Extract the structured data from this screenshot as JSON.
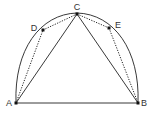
{
  "diagram": {
    "type": "geometry",
    "colors": {
      "stroke": "#222222",
      "point": "#111111",
      "label": "#333333",
      "background": "#ffffff"
    },
    "points": [
      {
        "id": "A",
        "label": "A",
        "x": 16,
        "y": 103,
        "lx": 9,
        "ly": 106
      },
      {
        "id": "B",
        "label": "B",
        "x": 138,
        "y": 103,
        "lx": 144,
        "ly": 106
      },
      {
        "id": "C",
        "label": "C",
        "x": 77,
        "y": 14,
        "lx": 77,
        "ly": 10
      },
      {
        "id": "D",
        "label": "D",
        "x": 43,
        "y": 30,
        "lx": 34,
        "ly": 31
      },
      {
        "id": "E",
        "label": "E",
        "x": 109,
        "y": 28,
        "lx": 118,
        "ly": 28
      }
    ],
    "solid_segments": [
      [
        "A",
        "B"
      ],
      [
        "A",
        "C"
      ],
      [
        "C",
        "B"
      ]
    ],
    "dotted_segments": [
      [
        "A",
        "D"
      ],
      [
        "D",
        "C"
      ],
      [
        "C",
        "E"
      ],
      [
        "E",
        "B"
      ]
    ],
    "arc": {
      "from": "A",
      "through": "C",
      "to": "B"
    }
  }
}
